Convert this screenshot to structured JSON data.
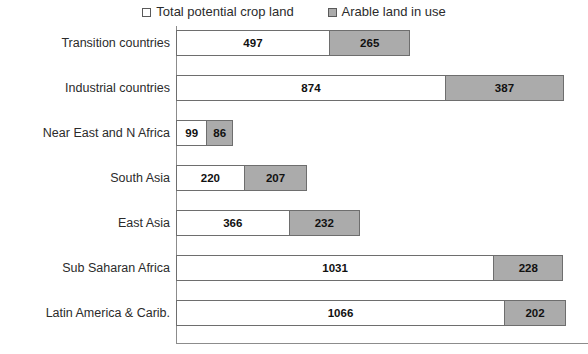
{
  "legend": {
    "position": "top-center",
    "entries": [
      {
        "label": "Total potential crop land",
        "swatch": "legend-swatch-white",
        "color": "#ffffff"
      },
      {
        "label": "Arable land in use",
        "swatch": "legend-swatch-gray",
        "color": "#ababab"
      }
    ]
  },
  "axis": {
    "x_start_px": 176,
    "px_per_unit": 0.3077
  },
  "chart_data": {
    "type": "bar",
    "orientation": "horizontal",
    "stacked": true,
    "title": "",
    "subtitle": "",
    "xlabel": "",
    "ylabel": "",
    "grid": false,
    "legend_position": "top-center",
    "xlim": [
      0,
      1261
    ],
    "axis_ticks_visible": false,
    "categories": [
      "Transition  countries",
      "Industrial countries",
      "Near East and N Africa",
      "South Asia",
      "East Asia",
      "Sub Saharan Africa",
      "Latin America & Carib."
    ],
    "series": [
      {
        "name": "Total potential crop land",
        "color": "#ffffff",
        "values": [
          497,
          874,
          99,
          220,
          366,
          1031,
          1066
        ]
      },
      {
        "name": "Arable land in use",
        "color": "#ababab",
        "values": [
          265,
          387,
          86,
          207,
          232,
          228,
          202
        ]
      }
    ],
    "totals": [
      762,
      1261,
      185,
      427,
      598,
      1259,
      1268
    ],
    "data_labels": [
      {
        "category": "Transition  countries",
        "white": "497",
        "gray": "265"
      },
      {
        "category": "Industrial countries",
        "white": "874",
        "gray": "387"
      },
      {
        "category": "Near East and N Africa",
        "white": "99",
        "gray": "86"
      },
      {
        "category": "South Asia",
        "white": "220",
        "gray": "207"
      },
      {
        "category": "East Asia",
        "white": "366",
        "gray": "232"
      },
      {
        "category": "Sub Saharan Africa",
        "white": "1031",
        "gray": "228"
      },
      {
        "category": "Latin America & Carib.",
        "white": "1066",
        "gray": "202"
      }
    ]
  }
}
